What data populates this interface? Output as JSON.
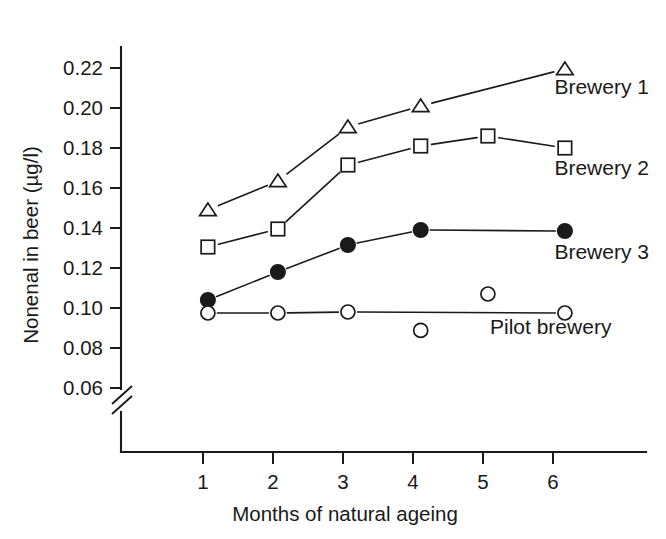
{
  "chart_data": {
    "type": "line",
    "title": "",
    "xlabel": "Months of natural ageing",
    "ylabel": "Nonenal in beer (µg/l)",
    "x": [
      1,
      2,
      3,
      4,
      5,
      6
    ],
    "xtick_labels": [
      "1",
      "2",
      "3",
      "4",
      "5",
      "6"
    ],
    "xlim": [
      0.4,
      6.7
    ],
    "ylim": [
      0.06,
      0.232
    ],
    "ytick_values": [
      0.06,
      0.08,
      0.1,
      0.12,
      0.14,
      0.16,
      0.18,
      0.2,
      0.22
    ],
    "ytick_labels": [
      "0.06",
      "0.08",
      "0.10",
      "0.12",
      "0.14",
      "0.16",
      "0.18",
      "0.20",
      "0.22"
    ],
    "grid": false,
    "axis_break": true,
    "axis_break_note": "y-axis broken below 0.06",
    "legend_position": "inline-right-of-series",
    "series": [
      {
        "name": "Brewery 1",
        "marker": "open-triangle",
        "label": "Brewery 1",
        "connected": [
          1,
          2,
          3,
          4,
          6
        ],
        "points": [
          {
            "x": 1.07,
            "y": 0.149
          },
          {
            "x": 2.07,
            "y": 0.1635
          },
          {
            "x": 3.07,
            "y": 0.1905
          },
          {
            "x": 4.11,
            "y": 0.201
          },
          {
            "x": 6.17,
            "y": 0.2195
          }
        ]
      },
      {
        "name": "Brewery 2",
        "marker": "open-square",
        "label": "Brewery 2",
        "connected": [
          1,
          2,
          3,
          4,
          5,
          6
        ],
        "points": [
          {
            "x": 1.07,
            "y": 0.1305
          },
          {
            "x": 2.07,
            "y": 0.1395
          },
          {
            "x": 3.07,
            "y": 0.1715
          },
          {
            "x": 4.11,
            "y": 0.181
          },
          {
            "x": 5.07,
            "y": 0.186
          },
          {
            "x": 6.17,
            "y": 0.18
          }
        ]
      },
      {
        "name": "Brewery 3",
        "marker": "filled-circle",
        "label": "Brewery 3",
        "connected": [
          1,
          2,
          3,
          4,
          6
        ],
        "points": [
          {
            "x": 1.07,
            "y": 0.104
          },
          {
            "x": 2.07,
            "y": 0.118
          },
          {
            "x": 3.07,
            "y": 0.1315
          },
          {
            "x": 4.11,
            "y": 0.139
          },
          {
            "x": 6.17,
            "y": 0.1385
          }
        ]
      },
      {
        "name": "Pilot brewery",
        "marker": "open-circle",
        "label": "Pilot brewery",
        "connected": [
          1,
          2,
          3,
          6
        ],
        "points": [
          {
            "x": 1.07,
            "y": 0.0975
          },
          {
            "x": 2.07,
            "y": 0.0975
          },
          {
            "x": 3.07,
            "y": 0.098
          },
          {
            "x": 4.11,
            "y": 0.0888
          },
          {
            "x": 5.07,
            "y": 0.107
          },
          {
            "x": 6.17,
            "y": 0.0975
          }
        ]
      }
    ],
    "series_label_positions": [
      {
        "name": "Brewery 1",
        "x": 6.02,
        "y": 0.207
      },
      {
        "name": "Brewery 2",
        "x": 6.02,
        "y": 0.1665
      },
      {
        "name": "Brewery 3",
        "x": 6.02,
        "y": 0.1245
      },
      {
        "name": "Pilot brewery",
        "x": 5.1,
        "y": 0.087
      }
    ]
  }
}
